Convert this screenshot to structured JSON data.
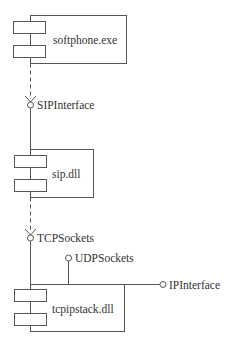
{
  "diagram": {
    "type": "UML component diagram",
    "components": [
      {
        "id": "softphone",
        "label": "softphone.exe"
      },
      {
        "id": "sip",
        "label": "sip.dll"
      },
      {
        "id": "tcpipstack",
        "label": "tcpipstack.dll"
      }
    ],
    "interfaces": [
      {
        "id": "sipinterface",
        "label": "SIPInterface",
        "provided_by": "sip",
        "required_by": "softphone"
      },
      {
        "id": "tcpsockets",
        "label": "TCPSockets",
        "provided_by": "tcpipstack",
        "required_by": "sip"
      },
      {
        "id": "udpsockets",
        "label": "UDPSockets",
        "provided_by": "tcpipstack"
      },
      {
        "id": "ipinterface",
        "label": "IPInterface",
        "provided_by": "tcpipstack"
      }
    ],
    "colors": {
      "line": "#555555",
      "text": "#333333",
      "background": "#ffffff"
    }
  }
}
